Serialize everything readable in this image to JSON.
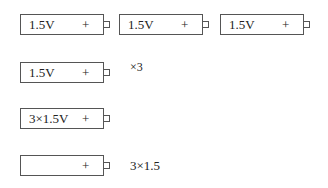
{
  "rows": [
    {
      "batteries": [
        {
          "label": "1.5V",
          "plus": "+"
        },
        {
          "label": "1.5V",
          "plus": "+"
        },
        {
          "label": "1.5V",
          "plus": "+"
        }
      ]
    },
    {
      "batteries": [
        {
          "label": "1.5V",
          "plus": "+"
        }
      ],
      "note": "×3"
    },
    {
      "batteries": [
        {
          "label": "3×1.5V",
          "plus": "+"
        }
      ]
    },
    {
      "batteries": [
        {
          "label": "",
          "plus": "+"
        }
      ],
      "note": "3×1.5"
    }
  ]
}
